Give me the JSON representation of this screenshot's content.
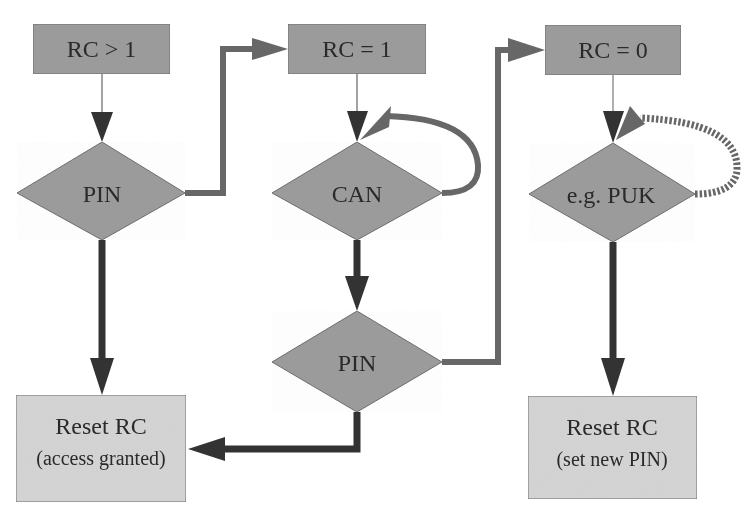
{
  "colors": {
    "background": "#ffffff",
    "state_box_fill": "#9c9c9c",
    "diamond_fill": "#9c9c9c",
    "result_box_fill": "#d4d4d4",
    "outline": "#6e6e6e",
    "thin_arrow": "#555555",
    "dark_arrow": "#333333",
    "gray_arrow": "#676767",
    "text": "#2a2a2a"
  },
  "states": [
    {
      "id": "rc-gt-1",
      "label": "RC > 1"
    },
    {
      "id": "rc-eq-1",
      "label": "RC = 1"
    },
    {
      "id": "rc-eq-0",
      "label": "RC = 0"
    }
  ],
  "decisions": [
    {
      "id": "pin-1",
      "label": "PIN"
    },
    {
      "id": "can",
      "label": "CAN"
    },
    {
      "id": "pin-2",
      "label": "PIN"
    },
    {
      "id": "puk",
      "label": "e.g. PUK"
    }
  ],
  "results": [
    {
      "id": "reset-access",
      "title": "Reset RC",
      "subtitle": "(access granted)"
    },
    {
      "id": "reset-newpin",
      "title": "Reset RC",
      "subtitle": "(set new PIN)"
    }
  ],
  "edges": [
    {
      "from": "RC > 1",
      "to": "PIN",
      "style": "thin"
    },
    {
      "from": "PIN",
      "to": "RC = 1",
      "style": "gray",
      "meaning": "failure"
    },
    {
      "from": "PIN",
      "to": "Reset RC (access granted)",
      "style": "dark",
      "meaning": "success"
    },
    {
      "from": "RC = 1",
      "to": "CAN",
      "style": "thin"
    },
    {
      "from": "CAN",
      "to": "CAN",
      "style": "gray-loop",
      "meaning": "failure"
    },
    {
      "from": "CAN",
      "to": "PIN",
      "style": "dark",
      "meaning": "success"
    },
    {
      "from": "PIN",
      "to": "Reset RC (access granted)",
      "style": "dark",
      "meaning": "success"
    },
    {
      "from": "PIN",
      "to": "RC = 0",
      "style": "gray",
      "meaning": "failure"
    },
    {
      "from": "RC = 0",
      "to": "e.g. PUK",
      "style": "thin"
    },
    {
      "from": "e.g. PUK",
      "to": "e.g. PUK",
      "style": "dotted-loop",
      "meaning": "failure"
    },
    {
      "from": "e.g. PUK",
      "to": "Reset RC (set new PIN)",
      "style": "dark",
      "meaning": "success"
    }
  ]
}
